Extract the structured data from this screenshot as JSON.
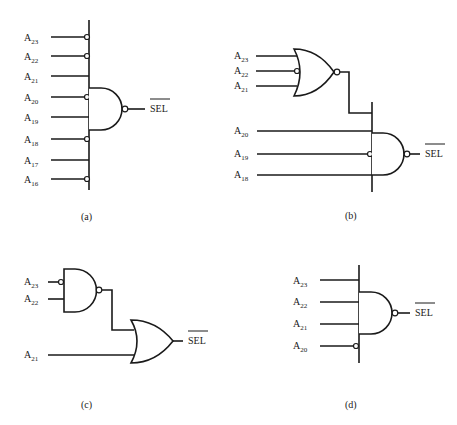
{
  "figure": {
    "output_label": "SEL",
    "output_overbar": true,
    "panels": [
      {
        "id": "a",
        "caption": "(a)",
        "gate": "NAND",
        "inputs": [
          {
            "name": "A",
            "sub": "23",
            "inverted": true
          },
          {
            "name": "A",
            "sub": "22",
            "inverted": true
          },
          {
            "name": "A",
            "sub": "21",
            "inverted": false
          },
          {
            "name": "A",
            "sub": "20",
            "inverted": true
          },
          {
            "name": "A",
            "sub": "19",
            "inverted": false
          },
          {
            "name": "A",
            "sub": "18",
            "inverted": true
          },
          {
            "name": "A",
            "sub": "17",
            "inverted": false
          },
          {
            "name": "A",
            "sub": "16",
            "inverted": true
          }
        ]
      },
      {
        "id": "b",
        "caption": "(b)",
        "first_gate": "NOR",
        "first_inputs": [
          {
            "name": "A",
            "sub": "23",
            "inverted": false
          },
          {
            "name": "A",
            "sub": "22",
            "inverted": true
          },
          {
            "name": "A",
            "sub": "21",
            "inverted": false
          }
        ],
        "gate": "NAND",
        "inputs": [
          {
            "name": "A",
            "sub": "20",
            "inverted": false
          },
          {
            "name": "A",
            "sub": "19",
            "inverted": true
          },
          {
            "name": "A",
            "sub": "18",
            "inverted": false
          }
        ]
      },
      {
        "id": "c",
        "caption": "(c)",
        "first_gate": "NAND",
        "first_inputs": [
          {
            "name": "A",
            "sub": "23",
            "inverted": true
          },
          {
            "name": "A",
            "sub": "22",
            "inverted": false
          }
        ],
        "gate": "OR",
        "inputs": [
          {
            "name": "A",
            "sub": "21",
            "inverted": false
          }
        ]
      },
      {
        "id": "d",
        "caption": "(d)",
        "gate": "NAND",
        "inputs": [
          {
            "name": "A",
            "sub": "23",
            "inverted": false
          },
          {
            "name": "A",
            "sub": "22",
            "inverted": false
          },
          {
            "name": "A",
            "sub": "21",
            "inverted": false
          },
          {
            "name": "A",
            "sub": "20",
            "inverted": true
          }
        ]
      }
    ]
  }
}
